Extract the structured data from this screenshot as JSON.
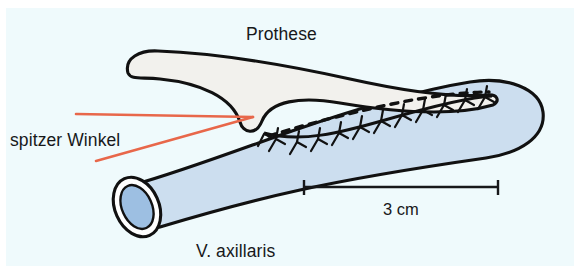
{
  "figure": {
    "type": "medical-anatomical-diagram",
    "language": "de",
    "background_color": "#effafc",
    "page_color": "#ffffff"
  },
  "labels": {
    "prosthesis": "Prothese",
    "acute_angle": "spitzer Winkel",
    "vein": "V. axillaris"
  },
  "scale_bar": {
    "label": "3 cm",
    "length_px": 196,
    "x_start": 303,
    "x_end": 499,
    "y": 187,
    "color": "#17181a"
  },
  "structures": {
    "prosthesis": {
      "name": "Prothese",
      "fill": "#f2f1ed",
      "stroke": "#111111",
      "stroke_width": 3.1
    },
    "vein": {
      "name": "V. axillaris",
      "fill": "#ccdeef",
      "stroke": "#111111",
      "stroke_width": 3.1,
      "lumen_fill": "#9dbfe2",
      "wall_fill": "#ffffff"
    },
    "anastomosis": {
      "dashed_line_color": "#111111",
      "suture_color": "#111111",
      "suture_count": 11
    },
    "angle_marker": {
      "color": "#e8674a",
      "stroke_width": 2.6,
      "apex_x": 253,
      "apex_y": 117
    }
  },
  "colors": {
    "accent_red": "#e8674a",
    "ink": "#111111",
    "vein_blue": "#ccdeef",
    "lumen_blue": "#9dbfe2",
    "graft_grey": "#f2f1ed",
    "panel_cyan": "#effafc"
  }
}
